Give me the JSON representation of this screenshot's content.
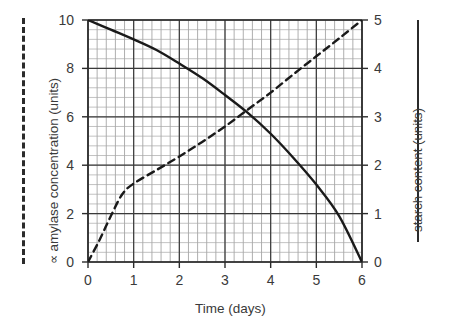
{
  "chart_data": {
    "type": "line",
    "title": "",
    "xlabel": "Time (days)",
    "xlim": [
      0,
      6
    ],
    "xticks": [
      0,
      1,
      2,
      3,
      4,
      5,
      6
    ],
    "xticklabels": [
      "0",
      "1",
      "2",
      "3",
      "4",
      "5",
      "6"
    ],
    "grid": true,
    "grid_minor": true,
    "minor_per_major_x": 5,
    "minor_per_major_y": 5,
    "legend_position": "outside-left-and-right-as-axis-keys",
    "axes": [
      {
        "id": "left",
        "label": "amylase concentration (units)",
        "label_prefix": "∝",
        "ylim": [
          0,
          10
        ],
        "yticks": [
          0,
          2,
          4,
          6,
          8,
          10
        ],
        "yticklabels": [
          "0",
          "2",
          "4",
          "6",
          "8",
          "10"
        ],
        "key_style": "dashed"
      },
      {
        "id": "right",
        "label": "starch content (units)",
        "label_prefix": "",
        "ylim": [
          0,
          5
        ],
        "yticks": [
          0,
          1,
          2,
          3,
          4,
          5
        ],
        "yticklabels": [
          "0",
          "1",
          "2",
          "3",
          "4",
          "5"
        ],
        "key_style": "solid"
      }
    ],
    "series": [
      {
        "name": "starch content",
        "axis": "right",
        "style": "solid",
        "color": "#1a1a1a",
        "x": [
          0,
          0.5,
          1,
          1.5,
          2,
          2.5,
          3,
          3.5,
          4,
          4.5,
          5,
          5.5,
          6
        ],
        "y": [
          5.0,
          4.8,
          4.6,
          4.38,
          4.1,
          3.8,
          3.45,
          3.08,
          2.65,
          2.15,
          1.6,
          0.95,
          0.0
        ]
      },
      {
        "name": "amylase concentration",
        "axis": "right",
        "style": "dashed",
        "color": "#1a1a1a",
        "x": [
          0,
          0.25,
          0.5,
          0.75,
          1,
          1.5,
          2,
          2.5,
          3,
          3.5,
          4,
          4.5,
          5,
          5.5,
          6
        ],
        "y": [
          0.0,
          0.45,
          0.95,
          1.4,
          1.62,
          1.9,
          2.18,
          2.48,
          2.8,
          3.15,
          3.5,
          3.88,
          4.25,
          4.62,
          5.0
        ]
      }
    ]
  }
}
